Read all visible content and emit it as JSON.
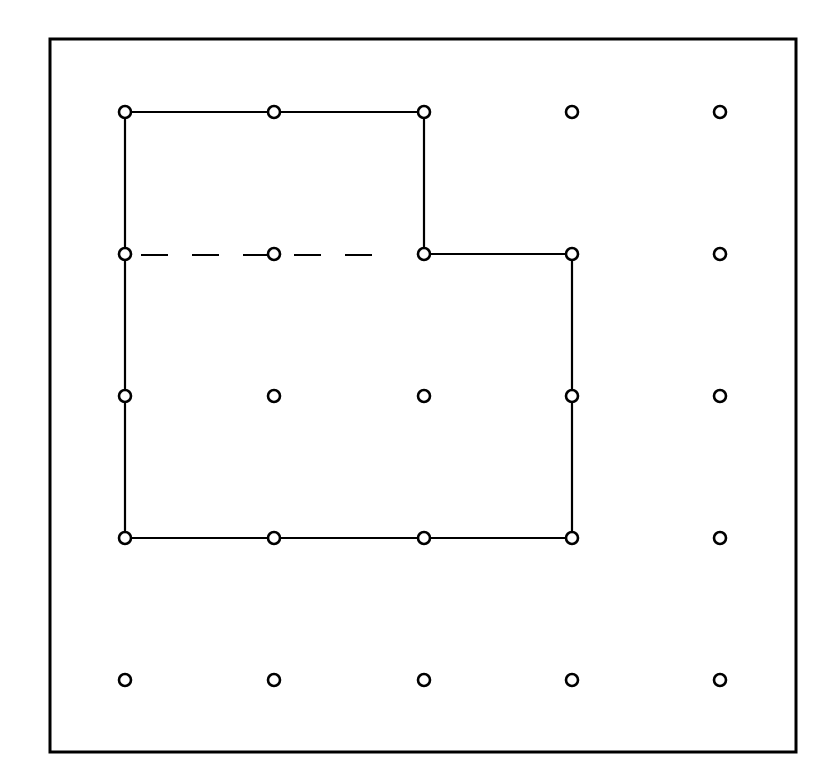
{
  "diagram": {
    "type": "geoboard",
    "grid": {
      "columns": 5,
      "rows": 5
    },
    "frame": {
      "x": 50,
      "y": 39,
      "width": 746,
      "height": 713,
      "stroke": "#000000",
      "stroke_width": 3
    },
    "peg_positions": {
      "x": [
        125,
        274,
        424,
        572,
        720
      ],
      "y": [
        112,
        254,
        396,
        538,
        680
      ]
    },
    "peg": {
      "radius": 6,
      "stroke_width": 2.6,
      "color": "#000000",
      "fill": "#ffffff"
    },
    "solid_shape": {
      "description": "L-shaped polygon (rectangle 3x3 with top-right 1x1 notch removed)",
      "vertices_grid": [
        [
          0,
          0
        ],
        [
          2,
          0
        ],
        [
          2,
          1
        ],
        [
          3,
          1
        ],
        [
          3,
          3
        ],
        [
          0,
          3
        ]
      ],
      "stroke": "#000000",
      "stroke_width": 2.2
    },
    "dashed_segment": {
      "from_grid": [
        0,
        1
      ],
      "to_grid": [
        2,
        1
      ],
      "dash": "27,24",
      "stroke": "#000000",
      "stroke_width": 2.2
    }
  }
}
